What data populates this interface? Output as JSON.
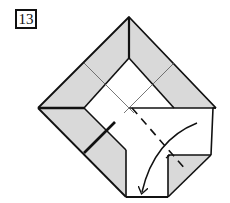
{
  "step": {
    "number": "13"
  },
  "colors": {
    "paper_back": "#d9d9d9",
    "paper_front": "#ffffff",
    "line": "#111111",
    "crease": "#555555"
  },
  "annotations": {
    "fold_type": "valley-fold",
    "arrow": "curved-fold-arrow"
  }
}
